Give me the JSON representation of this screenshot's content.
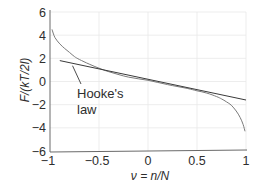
{
  "chart_data": {
    "type": "line",
    "title": "",
    "xlabel": "ν = n/N",
    "ylabel": "F/(kT/2l)",
    "xlim": [
      -1,
      1
    ],
    "ylim": [
      -6,
      6
    ],
    "xticks": [
      -1,
      -0.5,
      0,
      0.5,
      1
    ],
    "xtick_labels": [
      "−1",
      "−0.5",
      "0",
      "0.5",
      "1"
    ],
    "yticks": [
      6,
      4,
      2,
      0,
      -2,
      -4,
      -6
    ],
    "ytick_labels": [
      "6",
      "4",
      "2",
      "0",
      "−2",
      "−4",
      "−6"
    ],
    "grid": true,
    "legend": null,
    "series": [
      {
        "name": "exact force (inverse Langevin)",
        "x": [
          -0.98,
          -0.95,
          -0.9,
          -0.85,
          -0.8,
          -0.75,
          -0.7,
          -0.6,
          -0.5,
          -0.4,
          -0.2,
          0,
          0.2,
          0.4,
          0.5,
          0.6,
          0.7,
          0.75,
          0.8,
          0.85,
          0.9,
          0.94,
          0.97,
          0.99
        ],
        "y": [
          4.5,
          3.8,
          3.25,
          2.85,
          2.5,
          2.15,
          1.9,
          1.5,
          1.15,
          0.85,
          0.38,
          0.1,
          -0.27,
          -0.6,
          -0.8,
          -1.0,
          -1.3,
          -1.5,
          -1.75,
          -2.05,
          -2.55,
          -3.1,
          -3.7,
          -4.3
        ]
      },
      {
        "name": "Hooke's law",
        "x": [
          -0.9,
          1.0
        ],
        "y": [
          1.8,
          -1.6
        ]
      }
    ],
    "annotations": [
      {
        "text_lines": [
          "Hooke's",
          "law"
        ],
        "points_to": {
          "x": -0.77,
          "y": 1.45
        },
        "text_at": {
          "x": -0.72,
          "y": -0.9
        }
      }
    ]
  },
  "labels": {
    "xlabel": "ν = n/N",
    "ylabel": "F/(kT/2l)",
    "annotation_line1": "Hooke's",
    "annotation_line2": "law"
  }
}
